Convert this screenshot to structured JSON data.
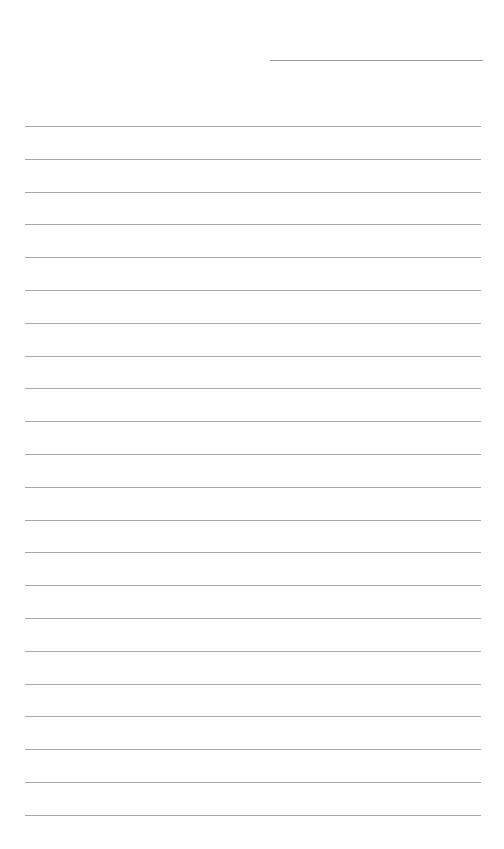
{
  "page": {
    "type": "blank lined paper",
    "background_color": "#ffffff",
    "line_color": "#a8a8a8",
    "header_line": {
      "x_start": 270,
      "x_end": 483,
      "y": 60
    },
    "ruled_lines": {
      "count": 22,
      "x_start": 25,
      "x_end": 481,
      "first_y": 126,
      "spacing": 32.8
    },
    "text": ""
  }
}
